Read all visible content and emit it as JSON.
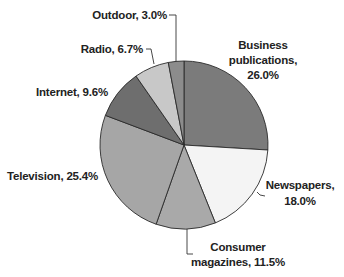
{
  "chart_data": {
    "type": "pie",
    "title": "",
    "start_angle_deg": 0,
    "direction": "clockwise",
    "center": [
      184,
      145
    ],
    "radius": 84,
    "slices": [
      {
        "name": "Business publications",
        "value": 26.0,
        "color": "#7b7b7b",
        "label_lines": [
          "Business",
          "publications,",
          "26.0%"
        ]
      },
      {
        "name": "Newspapers",
        "value": 18.0,
        "color": "#f4f4f4",
        "label_lines": [
          "Newspapers,",
          "18.0%"
        ]
      },
      {
        "name": "Consumer magazines",
        "value": 11.5,
        "color": "#a9a9a9",
        "label_lines": [
          "Consumer",
          "magazines, 11.5%"
        ]
      },
      {
        "name": "Television",
        "value": 25.4,
        "color": "#a6a6a6",
        "label_lines": [
          "Television, 25.4%"
        ]
      },
      {
        "name": "Internet",
        "value": 9.6,
        "color": "#6e6e6e",
        "label_lines": [
          "Internet, 9.6%"
        ]
      },
      {
        "name": "Radio",
        "value": 6.7,
        "color": "#c8c8c8",
        "label_lines": [
          "Radio, 6.7%"
        ]
      },
      {
        "name": "Outdoor",
        "value": 3.0,
        "color": "#8c8c8c",
        "label_lines": [
          "Outdoor, 3.0%"
        ]
      }
    ],
    "legend": "none (direct labels)"
  },
  "labels": {
    "business": {
      "line1": "Business",
      "line2": "publications,",
      "line3": "26.0%"
    },
    "newspapers": {
      "line1": "Newspapers,",
      "line2": "18.0%"
    },
    "consumer": {
      "line1": "Consumer",
      "line2": "magazines, 11.5%"
    },
    "television": {
      "line1": "Television, 25.4%"
    },
    "internet": {
      "line1": "Internet, 9.6%"
    },
    "radio": {
      "line1": "Radio, 6.7%"
    },
    "outdoor": {
      "line1": "Outdoor, 3.0%"
    }
  }
}
